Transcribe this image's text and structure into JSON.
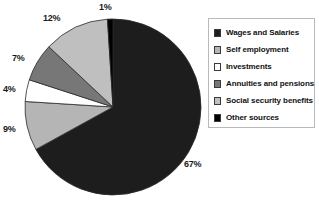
{
  "chart_data": {
    "type": "pie",
    "title": "",
    "categories": [
      "Wages and Salaries",
      "Self employment",
      "Investments",
      "Annuities and pensions",
      "Social security benefits",
      "Other sources"
    ],
    "values": [
      67,
      9,
      4,
      7,
      12,
      1
    ],
    "value_labels": [
      "67%",
      "9%",
      "4%",
      "7%",
      "12%",
      "1%"
    ],
    "colors": [
      "#1d1d1d",
      "#b5b5b5",
      "#ffffff",
      "#777777",
      "#bfbfbf",
      "#000000"
    ],
    "legend_position": "right",
    "grid": false,
    "units": "percent"
  },
  "legend": {
    "items": [
      {
        "label": "Wages and Salaries",
        "color": "#1d1d1d"
      },
      {
        "label": "Self employment",
        "color": "#b5b5b5"
      },
      {
        "label": "Investments",
        "color": "#ffffff"
      },
      {
        "label": "Annuities and pensions",
        "color": "#777777"
      },
      {
        "label": "Social security benefits",
        "color": "#bfbfbf"
      },
      {
        "label": "Other sources",
        "color": "#000000"
      }
    ]
  },
  "pie_labels": [
    {
      "text": "1%",
      "x": 99,
      "y": 2
    },
    {
      "text": "12%",
      "x": 43,
      "y": 13
    },
    {
      "text": "7%",
      "x": 12,
      "y": 53
    },
    {
      "text": "4%",
      "x": 3,
      "y": 84
    },
    {
      "text": "9%",
      "x": 3,
      "y": 124
    },
    {
      "text": "67%",
      "x": 184,
      "y": 159
    }
  ]
}
